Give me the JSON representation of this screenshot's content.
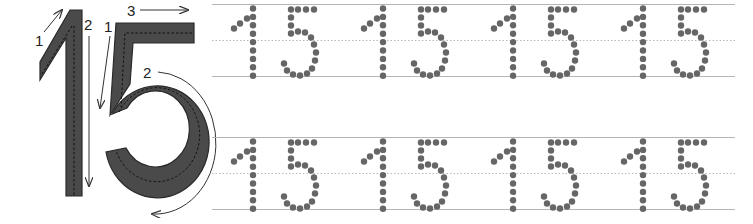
{
  "worksheet": {
    "number": "15",
    "model": {
      "digit_one": {
        "character": "1",
        "stroke_labels": [
          "1",
          "2"
        ]
      },
      "digit_five": {
        "character": "5",
        "stroke_labels": [
          "1",
          "2",
          "3"
        ]
      }
    },
    "practice_rows": [
      {
        "pairs": [
          "15",
          "15",
          "15",
          "15"
        ]
      },
      {
        "pairs": [
          "15",
          "15",
          "15",
          "15"
        ]
      }
    ]
  },
  "colors": {
    "digit_fill": "#4a4a4a",
    "digit_outline": "#2a2a2a",
    "dot": "#666666",
    "guide_line": "#b5b5b5",
    "midline": "#b8b8b8",
    "arrow": "#333333"
  }
}
